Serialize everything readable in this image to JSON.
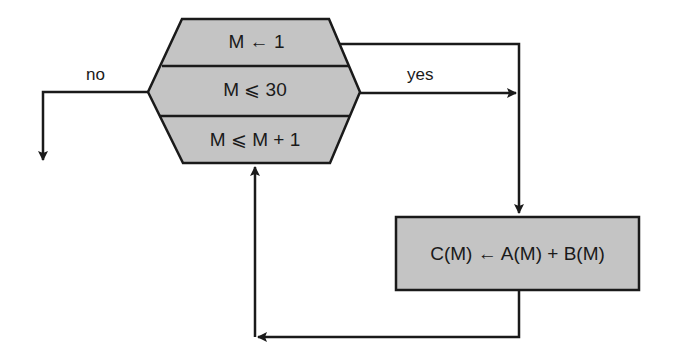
{
  "diagram": {
    "type": "flowchart",
    "colors": {
      "fill": "#c4c4c4",
      "stroke": "#1a1a1a",
      "background": "#ffffff"
    },
    "loop_block": {
      "shape": "hexagon",
      "cells": [
        {
          "role": "initialize",
          "text": "M ← 1"
        },
        {
          "role": "test",
          "text": "M ⩽ 30"
        },
        {
          "role": "increment",
          "text": "M ⩽ M + 1"
        }
      ]
    },
    "process_box": {
      "text": "C(M) ← A(M) + B(M)"
    },
    "edges": [
      {
        "from": "test",
        "to": "exit",
        "label": "no"
      },
      {
        "from": "test",
        "to": "process",
        "label": "yes"
      },
      {
        "from": "initialize",
        "to": "process",
        "label": ""
      },
      {
        "from": "process",
        "to": "increment",
        "label": ""
      }
    ],
    "labels": {
      "no": "no",
      "yes": "yes"
    }
  }
}
